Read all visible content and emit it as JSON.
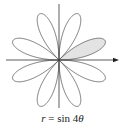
{
  "diagram": {
    "type": "polar-rose",
    "equation": "r = sin 4θ",
    "caption": {
      "var_r": "r",
      "equals": " = ",
      "func": "sin 4",
      "var_theta": "θ"
    },
    "petals": 8,
    "shaded_petal_index": 0,
    "petal_center_angles_deg": [
      22.5,
      67.5,
      112.5,
      157.5,
      202.5,
      247.5,
      292.5,
      337.5
    ],
    "colors": {
      "curve": "#555555",
      "axes": "#333333",
      "shade": "#e3e3e3"
    },
    "axes": {
      "horizontal_arrow": true,
      "vertical_arrow": false
    }
  }
}
